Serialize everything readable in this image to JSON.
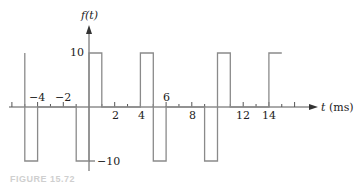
{
  "chart_data": {
    "type": "line",
    "title": "",
    "xlabel": "t (ms)",
    "ylabel": "f(t)",
    "x_ticks": [
      -4,
      -2,
      2,
      4,
      6,
      8,
      12,
      14
    ],
    "y_ticks": [
      10,
      -10
    ],
    "xlim": [
      -6.5,
      18
    ],
    "ylim": [
      -12,
      15
    ],
    "grid": false,
    "legend": null,
    "series": [
      {
        "name": "f(t)",
        "points": [
          [
            -5,
            10
          ],
          [
            -5,
            -10
          ],
          [
            -4,
            -10
          ],
          [
            -4,
            0
          ],
          [
            -1,
            0
          ],
          [
            -1,
            -10
          ],
          [
            0,
            -10
          ],
          [
            0,
            10
          ],
          [
            1,
            10
          ],
          [
            1,
            0
          ],
          [
            4,
            0
          ],
          [
            4,
            10
          ],
          [
            5,
            10
          ],
          [
            5,
            -10
          ],
          [
            6,
            -10
          ],
          [
            6,
            0
          ],
          [
            9,
            0
          ],
          [
            9,
            -10
          ],
          [
            10,
            -10
          ],
          [
            10,
            10
          ],
          [
            11,
            10
          ],
          [
            11,
            0
          ],
          [
            14,
            0
          ],
          [
            14,
            10
          ],
          [
            15,
            10
          ]
        ]
      }
    ]
  },
  "labels": {
    "y_axis": "f(t)",
    "x_axis": "t (ms)",
    "y_pos": "10",
    "y_neg": "−10",
    "x_ticks": [
      "−4",
      "−2",
      "2",
      "4",
      "6",
      "8",
      "12",
      "14"
    ]
  },
  "caption": "FIGURE 15.72"
}
